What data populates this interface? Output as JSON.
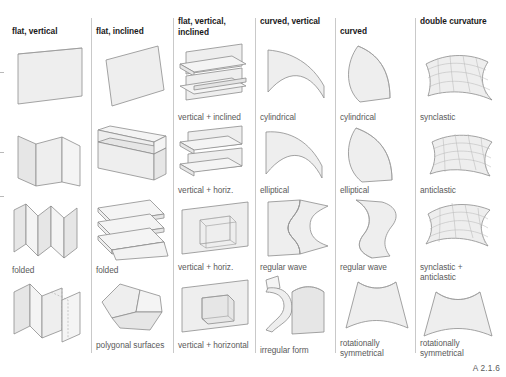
{
  "figure": {
    "caption_code": "A 2.1.6",
    "surface_fill": "#eeeeee",
    "surface_stroke": "#8d8d8d",
    "rule_color": "#c9c9c9",
    "header_color": "#1a1a1a",
    "caption_color": "#5a5a5a"
  },
  "columns": [
    {
      "id": "flat-vertical",
      "header": "flat, vertical",
      "cells": [
        {
          "label": "",
          "shape": "flat-vertical-plane"
        },
        {
          "label": "",
          "shape": "flat-vertical-folded-three"
        },
        {
          "label": "folded",
          "shape": "flat-vertical-accordion"
        },
        {
          "label": "",
          "shape": "flat-vertical-zigzag-pair"
        }
      ]
    },
    {
      "id": "flat-inclined",
      "header": "flat, inclined",
      "cells": [
        {
          "label": "",
          "shape": "flat-inclined-plane"
        },
        {
          "label": "",
          "shape": "flat-inclined-bent"
        },
        {
          "label": "folded",
          "shape": "flat-inclined-stacked-folds"
        },
        {
          "label": "polygonal surfaces",
          "shape": "polygonal-surfaces"
        }
      ]
    },
    {
      "id": "flat-vertical-inclined",
      "header": "flat, vertical, inclined",
      "cells": [
        {
          "label": "vertical + inclined",
          "shape": "vertical-inclined-shelves"
        },
        {
          "label": "vertical + horiz.",
          "shape": "vertical-horizontal-shelves"
        },
        {
          "label": "vertical + horiz.",
          "shape": "plane-with-open-box"
        },
        {
          "label": "vertical + horizontal",
          "shape": "plane-with-closed-box"
        }
      ]
    },
    {
      "id": "curved-vertical",
      "header": "curved, vertical",
      "cells": [
        {
          "label": "cylindrical",
          "shape": "cv-cylindrical"
        },
        {
          "label": "elliptical",
          "shape": "cv-elliptical"
        },
        {
          "label": "regular wave",
          "shape": "cv-regular-wave"
        },
        {
          "label": "irregular form",
          "shape": "cv-irregular-form"
        }
      ]
    },
    {
      "id": "curved",
      "header": "curved",
      "cells": [
        {
          "label": "cylindrical",
          "shape": "c-cylindrical"
        },
        {
          "label": "elliptical",
          "shape": "c-elliptical"
        },
        {
          "label": "regular wave",
          "shape": "c-regular-wave"
        },
        {
          "label": "rotationally symmetrical",
          "shape": "c-rotational"
        }
      ]
    },
    {
      "id": "double-curvature",
      "header": "double curvature",
      "cells": [
        {
          "label": "synclastic",
          "shape": "dc-synclastic"
        },
        {
          "label": "anticlastic",
          "shape": "dc-anticlastic"
        },
        {
          "label": "synclastic + anticlastic",
          "shape": "dc-synclastic-anticlastic"
        },
        {
          "label": "rotationally symmetrical",
          "shape": "dc-rotational"
        }
      ]
    }
  ]
}
